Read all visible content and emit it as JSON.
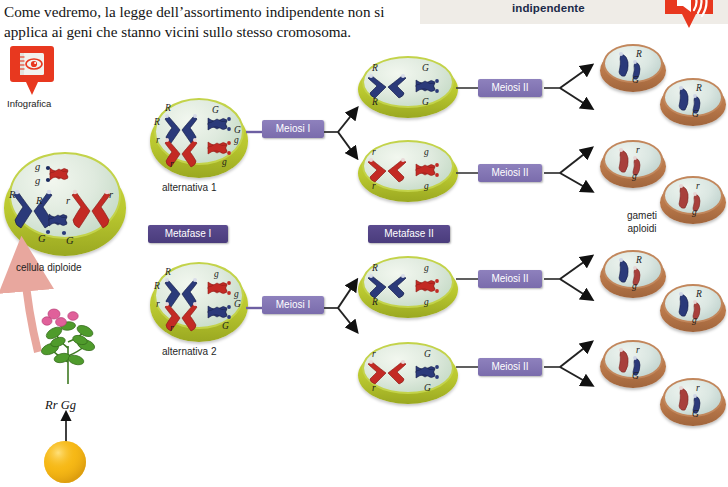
{
  "topbar": {
    "title": "indipendente",
    "audio_icon": "speaker-icon"
  },
  "intro": {
    "text": "Come vedremo, la legge dell’assortimento indipendente non si applica ai geni che stanno vicini sullo stesso cromosoma."
  },
  "infografica": {
    "label": "Infografica",
    "icon": "infographic-eye-notebook-icon"
  },
  "source_cell": {
    "caption": "cellula diploide",
    "alleles": [
      "g",
      "g",
      "R",
      "R",
      "r",
      "r",
      "G",
      "G"
    ]
  },
  "plant": {
    "genotype": "Rr Gg",
    "icon": "pea-plant-icon",
    "seed_icon": "pea-seed-icon"
  },
  "stage_labels": {
    "metaphase_1": "Metafase I",
    "metaphase_2": "Metafase II",
    "meiosis_1": "Meiosi I",
    "meiosis_2": "Meiosi II"
  },
  "alternatives": [
    {
      "caption": "alternativa 1",
      "alleles": [
        "R",
        "R",
        "G",
        "G",
        "r",
        "r",
        "g",
        "g"
      ]
    },
    {
      "caption": "alternativa 2",
      "alleles": [
        "R",
        "R",
        "g",
        "g",
        "r",
        "r",
        "G",
        "G"
      ]
    }
  ],
  "metaphase2_cells": [
    {
      "alleles": [
        "R",
        "R",
        "G",
        "G"
      ]
    },
    {
      "alleles": [
        "r",
        "r",
        "g",
        "g"
      ]
    },
    {
      "alleles": [
        "R",
        "R",
        "g",
        "g"
      ]
    },
    {
      "alleles": [
        "r",
        "r",
        "G",
        "G"
      ]
    }
  ],
  "gametes": {
    "caption_line1": "gameti",
    "caption_line2": "aploidi",
    "cells": [
      {
        "alleles": [
          "R",
          "G"
        ]
      },
      {
        "alleles": [
          "R",
          "G"
        ]
      },
      {
        "alleles": [
          "r",
          "g"
        ]
      },
      {
        "alleles": [
          "r",
          "g"
        ]
      },
      {
        "alleles": [
          "R",
          "g"
        ]
      },
      {
        "alleles": [
          "R",
          "g"
        ]
      },
      {
        "alleles": [
          "r",
          "G"
        ]
      },
      {
        "alleles": [
          "r",
          "G"
        ]
      }
    ]
  },
  "colors": {
    "accent_red": "#e8381f",
    "cell_green": "#bfcd36",
    "cell_brown": "#b9784a",
    "chromosome_blue": "#2b3a7a",
    "chromosome_red": "#c32a24",
    "label_dark_purple": "#4f4089",
    "label_light_purple": "#8478b6"
  }
}
